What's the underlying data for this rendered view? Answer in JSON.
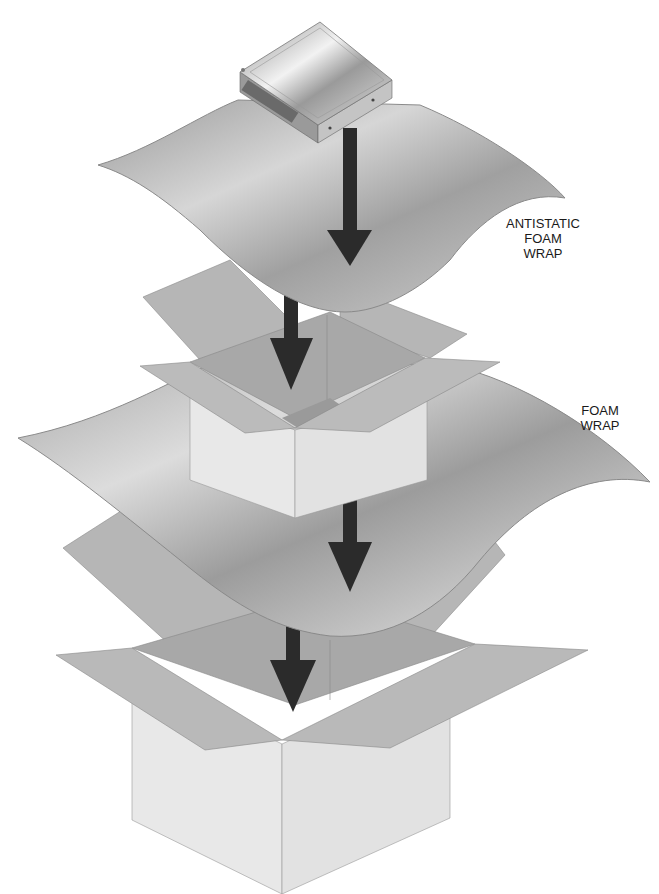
{
  "figure": {
    "labels": {
      "antistatic_wrap": [
        "ANTISTATIC",
        "FOAM",
        "WRAP"
      ],
      "foam_wrap": [
        "FOAM",
        "WRAP"
      ]
    },
    "components": [
      {
        "name": "hard-drive",
        "order": 1
      },
      {
        "name": "antistatic-foam-wrap",
        "order": 2
      },
      {
        "name": "inner-box",
        "order": 3
      },
      {
        "name": "foam-wrap",
        "order": 4
      },
      {
        "name": "outer-box",
        "order": 5
      }
    ],
    "colors": {
      "arrow": "#2b2b2b",
      "wrap_light": "#d8d8d8",
      "wrap_dark": "#8f8f8f",
      "box_side": "#e6e6e6",
      "box_flap": "#b4b4b4",
      "box_inner": "#a5a5a5",
      "drive": "#c9c9c9"
    }
  }
}
